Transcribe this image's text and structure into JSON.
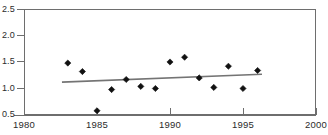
{
  "chart_data": {
    "type": "scatter",
    "title": "",
    "xlabel": "",
    "ylabel": "",
    "xlim": [
      1980,
      2000
    ],
    "ylim": [
      0.5,
      2.5
    ],
    "grid": false,
    "legend": null,
    "x_ticks": [
      1980,
      1985,
      1990,
      1995,
      2000
    ],
    "x_tick_labels": [
      "1980",
      "1985",
      "1990",
      "1995",
      "2000"
    ],
    "y_ticks": [
      0.5,
      1.0,
      1.5,
      2.0,
      2.5
    ],
    "y_tick_labels": [
      "0.5",
      "1.0",
      "1.5",
      "2.0",
      "2.5"
    ],
    "marker_style": "filled-diamond",
    "marker_color": "#111111",
    "series": [
      {
        "name": "observations",
        "x": [
          1983,
          1984,
          1985,
          1986,
          1987,
          1988,
          1989,
          1990,
          1991,
          1992,
          1993,
          1994,
          1995,
          1996
        ],
        "values": [
          1.48,
          1.32,
          0.58,
          0.98,
          1.17,
          1.04,
          1.0,
          1.5,
          1.59,
          1.2,
          1.02,
          1.42,
          1.0,
          1.34
        ]
      }
    ],
    "trend_line": {
      "name": "linear-trend",
      "color": "#747474",
      "x_start": 1982.6,
      "y_start": 1.12,
      "x_end": 1996.3,
      "y_end": 1.27
    },
    "title_remnant": ""
  },
  "axes": {
    "y_axis_name": "y-axis",
    "x_axis_name": "x-axis"
  }
}
